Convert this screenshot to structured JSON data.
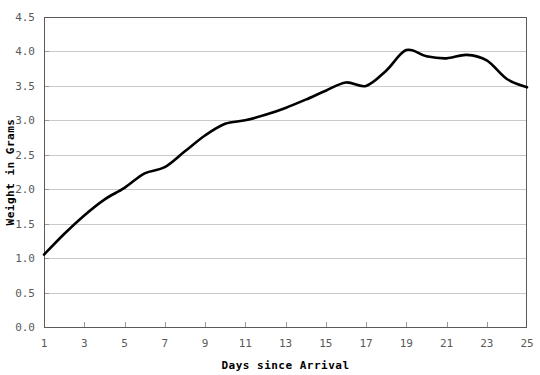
{
  "chart_data": {
    "type": "line",
    "title": "",
    "xlabel": "Days since Arrival",
    "ylabel": "Weight in Grams",
    "xlim": [
      1,
      25
    ],
    "ylim": [
      0.0,
      4.5
    ],
    "grid": true,
    "legend": "none",
    "line_color": "#000000",
    "grid_color": "#c9c9c9",
    "axis_color": "#5a5a5a",
    "xticks": [
      1,
      3,
      5,
      7,
      9,
      11,
      13,
      15,
      17,
      19,
      21,
      23,
      25
    ],
    "xtick_labels": [
      "1",
      "3",
      "5",
      "7",
      "9",
      "11",
      "13",
      "15",
      "17",
      "19",
      "21",
      "23",
      "25"
    ],
    "yticks": [
      0.0,
      0.5,
      1.0,
      1.5,
      2.0,
      2.5,
      3.0,
      3.5,
      4.0,
      4.5
    ],
    "ytick_labels": [
      "0.0",
      "0.5",
      "1.0",
      "1.5",
      "2.0",
      "2.5",
      "3.0",
      "3.5",
      "4.0",
      "4.5"
    ],
    "series": [
      {
        "name": "Weight",
        "x": [
          1,
          2,
          3,
          4,
          5,
          6,
          7,
          8,
          9,
          10,
          11,
          12,
          13,
          14,
          15,
          16,
          17,
          18,
          19,
          20,
          21,
          22,
          23,
          24,
          25
        ],
        "values": [
          1.05,
          1.35,
          1.62,
          1.85,
          2.02,
          2.23,
          2.32,
          2.55,
          2.78,
          2.95,
          3.0,
          3.08,
          3.18,
          3.3,
          3.43,
          3.55,
          3.5,
          3.72,
          4.02,
          3.93,
          3.9,
          3.95,
          3.87,
          3.6,
          3.48
        ]
      }
    ]
  }
}
